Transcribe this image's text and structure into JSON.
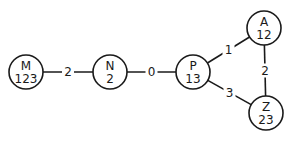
{
  "diagram": {
    "type": "weighted-graph",
    "nodes": [
      {
        "id": "M",
        "label": "M",
        "value": "123"
      },
      {
        "id": "N",
        "label": "N",
        "value": "2"
      },
      {
        "id": "P",
        "label": "P",
        "value": "13"
      },
      {
        "id": "A",
        "label": "A",
        "value": "12"
      },
      {
        "id": "Z",
        "label": "Z",
        "value": "23"
      }
    ],
    "edges": [
      {
        "from": "M",
        "to": "N",
        "weight": "2"
      },
      {
        "from": "N",
        "to": "P",
        "weight": "0"
      },
      {
        "from": "P",
        "to": "A",
        "weight": "1"
      },
      {
        "from": "A",
        "to": "Z",
        "weight": "2"
      },
      {
        "from": "P",
        "to": "Z",
        "weight": "3"
      }
    ],
    "colors": {
      "stroke": "#1a1a1a",
      "background": "#ffffff"
    }
  }
}
